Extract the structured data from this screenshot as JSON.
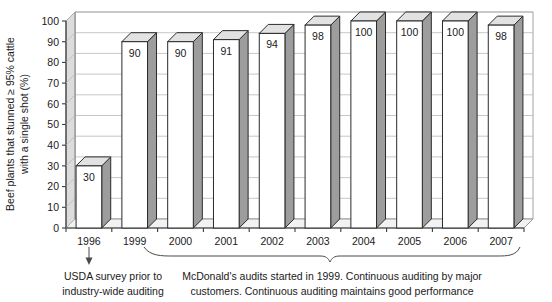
{
  "chart_data": {
    "type": "bar",
    "title": "",
    "subtitle": "",
    "xlabel": "",
    "ylabel": "Beef plants that stunned ≥ 95% cattle with a single shot (%)",
    "ylim": [
      0,
      100
    ],
    "ytick_labels": [
      "0",
      "10",
      "20",
      "30",
      "40",
      "50",
      "60",
      "70",
      "80",
      "90",
      "100"
    ],
    "ytick_values": [
      0,
      10,
      20,
      30,
      40,
      50,
      60,
      70,
      80,
      90,
      100
    ],
    "grid": true,
    "legend": "none",
    "categories": [
      "1996",
      "1999",
      "2000",
      "2001",
      "2002",
      "2003",
      "2004",
      "2005",
      "2006",
      "2007"
    ],
    "values": [
      30,
      90,
      90,
      91,
      94,
      98,
      100,
      100,
      100,
      98
    ],
    "data_labels": [
      "30",
      "90",
      "90",
      "91",
      "94",
      "98",
      "100",
      "100",
      "100",
      "98"
    ],
    "annotations": [
      {
        "name": "usda-note",
        "target_category": "1996",
        "marker": "down-arrow",
        "lines": [
          "USDA survey prior to",
          "industry-wide auditing"
        ]
      },
      {
        "name": "mcdonalds-note",
        "span_categories": [
          "1999",
          "2007"
        ],
        "marker": "curly-brace",
        "lines": [
          "McDonald's audits started in 1999. Continuous auditing by major",
          "customers. Continuous auditing maintains good performance"
        ]
      }
    ],
    "style": {
      "bar_front_color": "#ffffff",
      "bar_side_color": "#9d9d9d",
      "bar_top_color": "#e2e2e2",
      "bar_outline_color": "#2b2b2b",
      "gridline_color": "#b9b9b9",
      "axis_color": "#3a3a3a",
      "background_color": "#ffffff",
      "three_d": true
    }
  }
}
